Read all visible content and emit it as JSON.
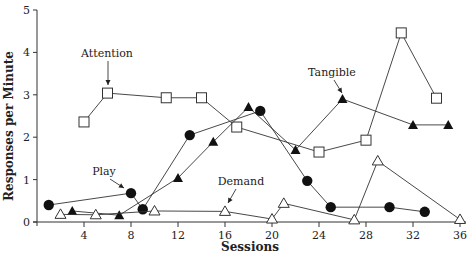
{
  "chart_data": {
    "type": "line",
    "title": "",
    "xlabel": "Sessions",
    "ylabel": "Responses per Minute",
    "xlim": [
      0,
      36
    ],
    "ylim": [
      0,
      5
    ],
    "xticks": [
      4,
      8,
      12,
      16,
      20,
      24,
      28,
      32,
      36
    ],
    "yticks": [
      0,
      1,
      2,
      3,
      4,
      5
    ],
    "grid": false,
    "legend": "none (inline labels with arrows)",
    "series": [
      {
        "name": "Attention",
        "marker": "open-square",
        "x": [
          4,
          6,
          11,
          14,
          17,
          24,
          28,
          31,
          34
        ],
        "values": [
          2.36,
          3.04,
          2.93,
          2.93,
          2.24,
          1.65,
          1.93,
          4.46,
          2.92
        ]
      },
      {
        "name": "Tangible",
        "marker": "filled-triangle",
        "x": [
          3,
          7,
          12,
          15,
          18,
          22,
          26,
          32,
          35
        ],
        "values": [
          0.26,
          0.16,
          1.04,
          1.89,
          2.71,
          1.7,
          2.9,
          2.29,
          2.29
        ]
      },
      {
        "name": "Play",
        "marker": "filled-circle",
        "x": [
          1,
          8,
          9,
          13,
          19,
          23,
          25,
          30,
          33
        ],
        "values": [
          0.4,
          0.68,
          0.3,
          2.05,
          2.62,
          0.97,
          0.35,
          0.35,
          0.24
        ]
      },
      {
        "name": "Demand",
        "marker": "open-triangle",
        "x": [
          2,
          5,
          10,
          16,
          20,
          21,
          27,
          29,
          36
        ],
        "values": [
          0.18,
          0.17,
          0.26,
          0.25,
          0.07,
          0.44,
          0.05,
          1.44,
          0.06
        ]
      }
    ],
    "annotations": [
      {
        "text": "Attention",
        "points_to": {
          "series": "Attention",
          "x": 6
        }
      },
      {
        "text": "Tangible",
        "points_to": {
          "series": "Tangible",
          "x": 26
        }
      },
      {
        "text": "Play",
        "points_to": {
          "series": "Play",
          "x": 8
        }
      },
      {
        "text": "Demand",
        "points_to": {
          "series": "Demand",
          "x": 16
        }
      }
    ]
  }
}
